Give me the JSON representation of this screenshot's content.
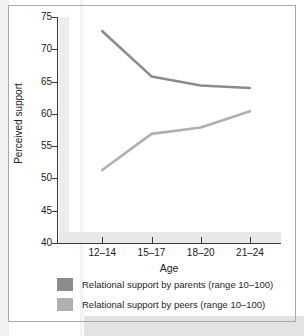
{
  "figure": {
    "caption": "",
    "colors": {
      "parents_line": "#8c8c8c",
      "peers_line": "#b0b0b0",
      "axis": "#3a3a3a",
      "border": "#a9a9a9",
      "scan_band": "#e3e3e3"
    }
  },
  "chart_data": {
    "type": "line",
    "title": "",
    "xlabel": "Age",
    "ylabel": "Perceived support",
    "categories": [
      "12–14",
      "15–17",
      "18–20",
      "21–24"
    ],
    "ylim": [
      40,
      75
    ],
    "yticks": [
      40,
      45,
      50,
      55,
      60,
      65,
      70,
      75
    ],
    "ytick_labels": [
      "40",
      "45",
      "50",
      "55",
      "60",
      "65",
      "70",
      "75"
    ],
    "grid": false,
    "legend_position": "below",
    "series": [
      {
        "name": "Relational support by parents (range 10–100)",
        "short_name": "parents",
        "color": "#8c8c8c",
        "values": [
          72.8,
          65.8,
          64.4,
          64.0
        ]
      },
      {
        "name": "Relational support by peers (range 10–100)",
        "short_name": "peers",
        "color": "#b0b0b0",
        "values": [
          51.3,
          56.9,
          57.9,
          60.4
        ]
      }
    ]
  },
  "legend": {
    "items": [
      {
        "label": "Relational support by parents (range 10–100)",
        "color": "#8c8c8c"
      },
      {
        "label": "Relational support by peers (range 10–100)",
        "color": "#b0b0b0"
      }
    ]
  }
}
